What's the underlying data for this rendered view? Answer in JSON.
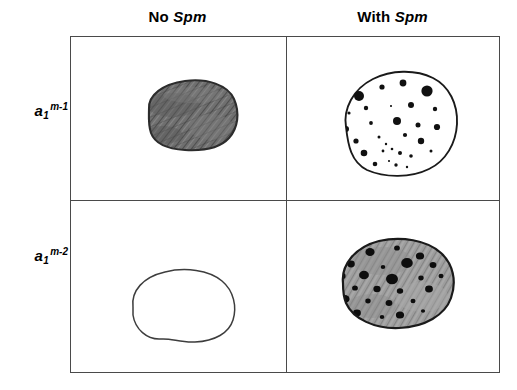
{
  "figure": {
    "caption_present": false,
    "columns": [
      {
        "id": "no-spm",
        "prefix": "No",
        "gene": "Spm",
        "label": "No Spm"
      },
      {
        "id": "with-spm",
        "prefix": "With",
        "gene": "Spm",
        "label": "With Spm"
      }
    ],
    "rows": [
      {
        "id": "a1-m1",
        "base": "a",
        "subscript": "1",
        "superscript": "m-1",
        "label": "a1 m-1"
      },
      {
        "id": "a1-m2",
        "base": "a",
        "subscript": "1",
        "superscript": "m-2",
        "label": "a1 m-2"
      }
    ],
    "cells": [
      {
        "id": "m1-nospm",
        "row": "a1-m1",
        "column": "no-spm",
        "phenotype": "fully pigmented",
        "fill_color": "#6d6d6d",
        "outline_color": "#2c2c2c",
        "spot_count": 0,
        "spots": []
      },
      {
        "id": "m1-withspm",
        "row": "a1-m1",
        "column": "with-spm",
        "phenotype": "colorless with dark spots",
        "fill_color": "#ffffff",
        "outline_color": "#1a1a1a",
        "spot_color": "#111111",
        "spot_count": 30,
        "spots": [
          [
            20,
            35,
            5.0
          ],
          [
            43,
            26,
            2.6
          ],
          [
            64,
            22,
            3.4
          ],
          [
            88,
            30,
            5.6
          ],
          [
            10,
            52,
            1.6
          ],
          [
            27,
            47,
            2.2
          ],
          [
            52,
            45,
            1.1
          ],
          [
            72,
            44,
            3.0
          ],
          [
            96,
            48,
            2.2
          ],
          [
            7,
            68,
            3.0
          ],
          [
            32,
            62,
            1.9
          ],
          [
            58,
            60,
            4.0
          ],
          [
            79,
            64,
            2.5
          ],
          [
            98,
            66,
            3.1
          ],
          [
            17,
            80,
            2.6
          ],
          [
            40,
            76,
            1.5
          ],
          [
            47,
            83,
            1.2
          ],
          [
            66,
            74,
            2.1
          ],
          [
            82,
            80,
            3.2
          ],
          [
            25,
            92,
            3.3
          ],
          [
            44,
            90,
            1.4
          ],
          [
            53,
            88,
            1.3
          ],
          [
            61,
            92,
            2.0
          ],
          [
            72,
            95,
            1.8
          ],
          [
            92,
            90,
            1.5
          ],
          [
            13,
            103,
            4.0
          ],
          [
            36,
            103,
            2.3
          ],
          [
            50,
            100,
            1.1
          ],
          [
            57,
            104,
            1.7
          ],
          [
            68,
            106,
            1.2
          ]
        ]
      },
      {
        "id": "m2-nospm",
        "row": "a1-m2",
        "column": "no-spm",
        "phenotype": "colorless",
        "fill_color": "#ffffff",
        "outline_color": "#3d3d3d",
        "spot_count": 0,
        "spots": []
      },
      {
        "id": "m2-withspm",
        "row": "a1-m2",
        "column": "with-spm",
        "phenotype": "pigmented with dark spots",
        "fill_color": "#9a9a9a",
        "outline_color": "#1a1a1a",
        "spot_color": "#0d0d0d",
        "spot_count": 24,
        "spots": [
          [
            33,
            21,
            4.0
          ],
          [
            60,
            17,
            2.6
          ],
          [
            83,
            25,
            3.6
          ],
          [
            14,
            33,
            3.4
          ],
          [
            46,
            36,
            2.0
          ],
          [
            70,
            32,
            5.0
          ],
          [
            96,
            34,
            3.0
          ],
          [
            5,
            45,
            3.2
          ],
          [
            27,
            44,
            4.3
          ],
          [
            55,
            48,
            5.2
          ],
          [
            84,
            47,
            2.4
          ],
          [
            104,
            45,
            2.2
          ],
          [
            18,
            57,
            2.6
          ],
          [
            40,
            58,
            3.2
          ],
          [
            63,
            60,
            2.8
          ],
          [
            92,
            58,
            3.4
          ],
          [
            8,
            68,
            4.0
          ],
          [
            31,
            70,
            2.4
          ],
          [
            52,
            72,
            3.0
          ],
          [
            76,
            70,
            2.2
          ],
          [
            20,
            82,
            3.4
          ],
          [
            45,
            86,
            2.0
          ],
          [
            63,
            84,
            3.6
          ],
          [
            86,
            80,
            1.8
          ]
        ]
      }
    ],
    "colors": {
      "frame": "#4a4a4a",
      "text": "#000000",
      "background": "#ffffff"
    }
  }
}
